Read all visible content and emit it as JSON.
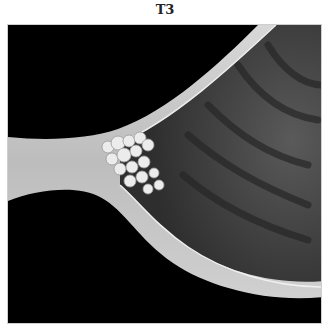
{
  "figure": {
    "title": "T3",
    "colors": {
      "background": "#000000",
      "wall": "#c9c9c9",
      "lumen": "#4a4a4a",
      "tumor": "#e8e8e8"
    }
  }
}
